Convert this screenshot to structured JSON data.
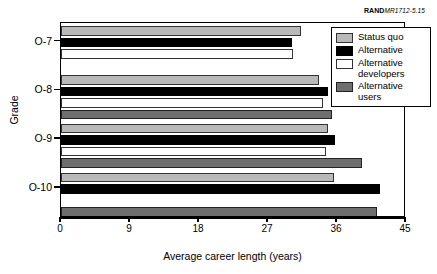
{
  "credit": {
    "rand": "RAND",
    "doc_id": "MR1712-5.15"
  },
  "chart_data": {
    "type": "bar",
    "orientation": "horizontal",
    "title": "",
    "xlabel": "Average career length (years)",
    "ylabel": "Grade",
    "categories": [
      "O-7",
      "O-8",
      "O-9",
      "O-10"
    ],
    "xticks": [
      0,
      9,
      18,
      27,
      36,
      45
    ],
    "xlim": [
      0,
      45
    ],
    "grid": false,
    "legend_position": "top-right",
    "series": [
      {
        "name": "Status quo",
        "color": "#b9b9b9",
        "values": [
          31.3,
          33.6,
          34.8,
          35.6
        ]
      },
      {
        "name": "Alternative",
        "color": "#000000",
        "values": [
          30.1,
          34.8,
          35.7,
          41.6
        ]
      },
      {
        "name": "Alternative developers",
        "color": "#ffffff",
        "values": [
          30.3,
          34.2,
          34.6,
          0
        ]
      },
      {
        "name": "Alternative users",
        "color": "#6e6e6e",
        "values": [
          0,
          35.3,
          39.2,
          41.2
        ]
      }
    ]
  },
  "legend": {
    "items": [
      {
        "label": "Status quo",
        "swatch": "c-statusquo"
      },
      {
        "label": "Alternative",
        "swatch": "c-alt"
      },
      {
        "label": "Alternative\ndevelopers",
        "swatch": "c-altdev"
      },
      {
        "label": "Alternative\nusers",
        "swatch": "c-altusers"
      }
    ]
  }
}
